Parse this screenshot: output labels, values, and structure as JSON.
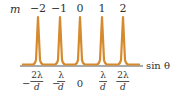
{
  "diagram": {
    "order_label": "m",
    "orders": [
      "−2",
      "−1",
      "0",
      "1",
      "2"
    ],
    "axis_label": "sin θ",
    "axis_ticks": [
      {
        "sign": "−",
        "num": "2λ",
        "den": "d"
      },
      {
        "sign": "−",
        "num": "λ",
        "den": "d"
      },
      {
        "value": "0"
      },
      {
        "sign": "",
        "num": "λ",
        "den": "d"
      },
      {
        "sign": "",
        "num": "2λ",
        "den": "d"
      }
    ],
    "peak_color": "#d68a2e",
    "axis_color": "#555555"
  }
}
